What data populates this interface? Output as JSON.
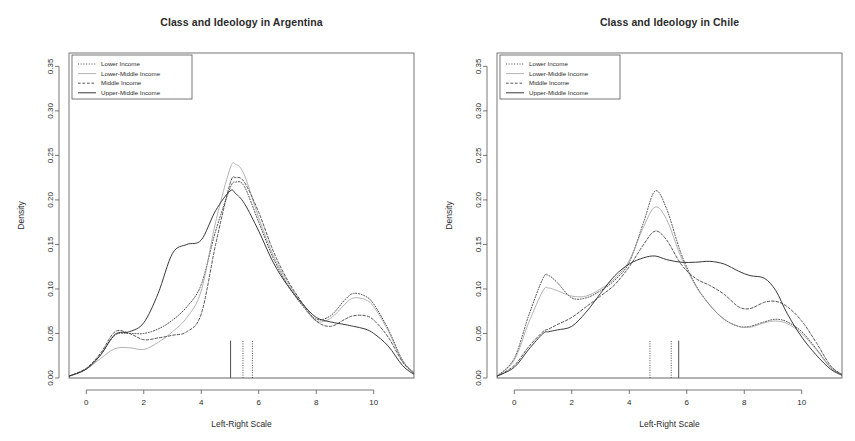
{
  "figure": {
    "panels": [
      "left",
      "right"
    ],
    "shared": {
      "xlabel": "Left-Right Scale",
      "ylabel": "Density",
      "xticks": [
        "0",
        "2",
        "4",
        "6",
        "8",
        "10"
      ],
      "xtick_values": [
        0,
        2,
        4,
        6,
        8,
        10
      ],
      "yticks": [
        "0.00",
        "0.05",
        "0.10",
        "0.15",
        "0.20",
        "0.25",
        "0.30",
        "0.35"
      ],
      "ytick_values": [
        0,
        0.05,
        0.1,
        0.15,
        0.2,
        0.25,
        0.3,
        0.35
      ],
      "xlim": [
        -0.6,
        11.4
      ],
      "ylim": [
        0,
        0.365
      ],
      "legend_position": "top-left",
      "grid": false,
      "series_names": [
        "Lower Income",
        "Lower-Middle Income",
        "Middle Income",
        "Upper-Middle Income"
      ],
      "series_styles": [
        "dotted",
        "thin-solid",
        "dashed",
        "solid"
      ],
      "series_colors": [
        "#3f3f3f",
        "#9a9a9a",
        "#4a4a4a",
        "#2e2e2e"
      ]
    },
    "left": {
      "title": "Class and Ideology in Argentina"
    },
    "right": {
      "title": "Class and Ideology in Chile"
    }
  },
  "chart_data": [
    {
      "type": "line",
      "panel": "left",
      "title": "Class and Ideology in Argentina",
      "xlabel": "Left-Right Scale",
      "ylabel": "Density",
      "xlim": [
        -0.6,
        11.4
      ],
      "ylim": [
        0,
        0.365
      ],
      "grid": false,
      "legend_position": "top-left",
      "x": [
        -0.6,
        0,
        0.5,
        1,
        1.5,
        2,
        2.5,
        3,
        3.5,
        4,
        4.5,
        5,
        5.2,
        5.5,
        6,
        6.5,
        7,
        7.5,
        8,
        8.5,
        9,
        9.3,
        9.7,
        10,
        10.5,
        11,
        11.4
      ],
      "series": [
        {
          "name": "Lower Income",
          "style": "dotted",
          "color": "#3f3f3f",
          "values": [
            0.002,
            0.01,
            0.026,
            0.048,
            0.05,
            0.05,
            0.055,
            0.065,
            0.08,
            0.105,
            0.165,
            0.213,
            0.22,
            0.215,
            0.175,
            0.135,
            0.105,
            0.082,
            0.066,
            0.07,
            0.088,
            0.095,
            0.092,
            0.083,
            0.055,
            0.02,
            0.006
          ]
        },
        {
          "name": "Lower-Middle Income",
          "style": "thin-solid",
          "color": "#9a9a9a",
          "values": [
            0.002,
            0.01,
            0.022,
            0.033,
            0.034,
            0.032,
            0.04,
            0.052,
            0.068,
            0.098,
            0.175,
            0.235,
            0.24,
            0.228,
            0.18,
            0.138,
            0.108,
            0.083,
            0.064,
            0.067,
            0.083,
            0.09,
            0.088,
            0.08,
            0.053,
            0.019,
            0.006
          ]
        },
        {
          "name": "Middle Income",
          "style": "dashed",
          "color": "#4a4a4a",
          "values": [
            0.002,
            0.011,
            0.028,
            0.052,
            0.05,
            0.043,
            0.045,
            0.048,
            0.052,
            0.072,
            0.15,
            0.218,
            0.225,
            0.22,
            0.186,
            0.143,
            0.11,
            0.085,
            0.064,
            0.058,
            0.066,
            0.07,
            0.07,
            0.065,
            0.046,
            0.018,
            0.005
          ]
        },
        {
          "name": "Upper-Middle Income",
          "style": "solid",
          "color": "#2e2e2e",
          "values": [
            0.002,
            0.01,
            0.026,
            0.049,
            0.052,
            0.062,
            0.095,
            0.14,
            0.15,
            0.155,
            0.188,
            0.21,
            0.207,
            0.196,
            0.165,
            0.13,
            0.104,
            0.084,
            0.068,
            0.063,
            0.06,
            0.058,
            0.055,
            0.05,
            0.036,
            0.014,
            0.004
          ]
        }
      ],
      "mean_markers": [
        {
          "series": "Upper-Middle Income",
          "x": 5.02,
          "style": "solid"
        },
        {
          "series": "Lower Income",
          "x": 5.45,
          "style": "dotted"
        },
        {
          "series": "Middle Income",
          "x": 5.78,
          "style": "dotted"
        }
      ]
    },
    {
      "type": "line",
      "panel": "right",
      "title": "Class and Ideology in Chile",
      "xlabel": "Left-Right Scale",
      "ylabel": "Density",
      "xlim": [
        -0.6,
        11.4
      ],
      "ylim": [
        0,
        0.365
      ],
      "grid": false,
      "legend_position": "top-left",
      "x": [
        -0.6,
        0,
        0.5,
        1,
        1.2,
        1.5,
        2,
        2.5,
        3,
        3.5,
        4,
        4.5,
        4.9,
        5.3,
        5.8,
        6.3,
        6.8,
        7.3,
        7.8,
        8.2,
        8.7,
        9.1,
        9.5,
        10,
        10.5,
        11,
        11.4
      ],
      "series": [
        {
          "name": "Lower Income",
          "style": "dotted",
          "color": "#3f3f3f",
          "values": [
            0.002,
            0.022,
            0.07,
            0.112,
            0.115,
            0.107,
            0.09,
            0.09,
            0.098,
            0.11,
            0.13,
            0.175,
            0.21,
            0.19,
            0.14,
            0.105,
            0.082,
            0.066,
            0.058,
            0.058,
            0.063,
            0.066,
            0.063,
            0.052,
            0.033,
            0.012,
            0.004
          ]
        },
        {
          "name": "Lower-Middle Income",
          "style": "thin-solid",
          "color": "#9a9a9a",
          "values": [
            0.002,
            0.02,
            0.062,
            0.098,
            0.101,
            0.098,
            0.092,
            0.092,
            0.1,
            0.112,
            0.132,
            0.17,
            0.192,
            0.178,
            0.136,
            0.104,
            0.082,
            0.066,
            0.058,
            0.057,
            0.062,
            0.064,
            0.061,
            0.05,
            0.032,
            0.012,
            0.004
          ]
        },
        {
          "name": "Middle Income",
          "style": "dashed",
          "color": "#4a4a4a",
          "values": [
            0.002,
            0.014,
            0.035,
            0.052,
            0.055,
            0.06,
            0.068,
            0.08,
            0.092,
            0.105,
            0.125,
            0.15,
            0.165,
            0.155,
            0.128,
            0.112,
            0.104,
            0.094,
            0.08,
            0.078,
            0.085,
            0.086,
            0.08,
            0.064,
            0.04,
            0.014,
            0.004
          ]
        },
        {
          "name": "Upper-Middle Income",
          "style": "solid",
          "color": "#2e2e2e",
          "values": [
            0.002,
            0.012,
            0.032,
            0.05,
            0.052,
            0.054,
            0.058,
            0.074,
            0.095,
            0.115,
            0.128,
            0.135,
            0.137,
            0.133,
            0.13,
            0.13,
            0.131,
            0.128,
            0.12,
            0.115,
            0.112,
            0.098,
            0.072,
            0.046,
            0.026,
            0.01,
            0.003
          ]
        }
      ],
      "mean_markers": [
        {
          "series": "Lower Income",
          "x": 4.72,
          "style": "dotted"
        },
        {
          "series": "Middle Income",
          "x": 5.46,
          "style": "dotted"
        },
        {
          "series": "Upper-Middle Income",
          "x": 5.72,
          "style": "solid"
        }
      ]
    }
  ]
}
